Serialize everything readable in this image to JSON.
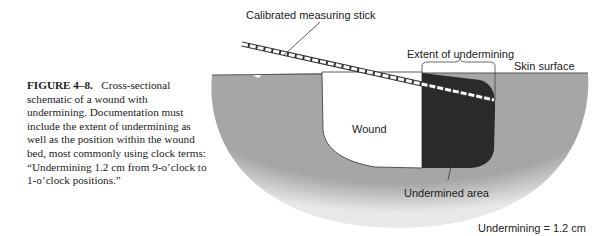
{
  "caption": {
    "figure_label": "FIGURE 4–8.",
    "text": "Cross-sectional schematic of a wound with undermining. Documentation must include the extent of undermining as well as the position within the wound bed, most commonly using clock terms: “Undermining 1.2 cm from 9-o’clock to 1-o’clock positions.”"
  },
  "labels": {
    "stick": "Calibrated measuring stick",
    "extent": "Extent of undermining",
    "skin": "Skin surface",
    "wound": "Wound",
    "undermined": "Undermined area",
    "measurement": "Undermining = 1.2 cm"
  },
  "colors": {
    "tissue": "#a8a8a8",
    "undermined": "#2a2a2a",
    "wound": "#ffffff"
  }
}
